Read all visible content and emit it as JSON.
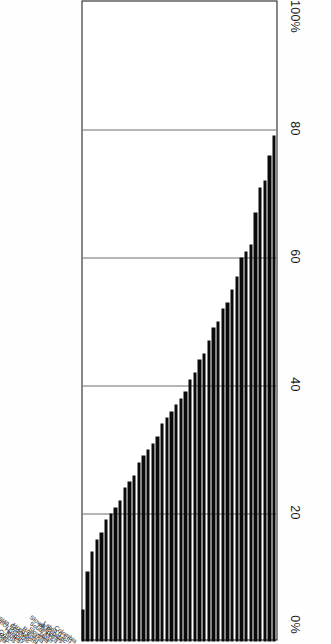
{
  "chart_data": {
    "type": "bar",
    "orientation": "vertical-rotated",
    "title": "",
    "subtitle": "",
    "xlabel": "",
    "ylabel": "",
    "ylim": [
      0,
      100
    ],
    "yticks": [
      "0%",
      "20",
      "40",
      "60",
      "80",
      "100%"
    ],
    "ytick_values": [
      0,
      20,
      40,
      60,
      80,
      100
    ],
    "axis_labels_display_order": [
      "100%",
      "80",
      "60",
      "40",
      "20",
      "0%"
    ],
    "grid": true,
    "legend": null,
    "legend_position": "none",
    "bar_color": "#0a0a0a",
    "categories": [
      "Colombia",
      "Latvia (LSS)",
      "Slovak Republic",
      "Philippines",
      "South Africa",
      "Japan",
      "Slovenia",
      "Romania",
      "Hong Kong",
      "Russian Federation",
      "Czech Republic",
      "Hungary",
      "Korea",
      "Cyprus",
      "Iran, Islamic Rep.",
      "Lithuania",
      "Greece",
      "Singapore",
      "Iceland",
      "U.S.A.",
      "Belgium (Fr)",
      "Belgium (Fl)",
      "Spain",
      "Ireland",
      "Canada",
      "Thailand",
      "Kuwait",
      "Israel",
      "Switzerland",
      "Poland",
      "Portugal",
      "New Zealand",
      "Scotland",
      "Australia",
      "Austria",
      "Netherlands",
      "France",
      "Sweden",
      "Germany",
      "Norway",
      "England",
      "Denmark"
    ],
    "values": [
      79,
      76,
      72,
      71,
      67,
      62,
      61,
      60,
      57,
      55,
      53,
      52,
      50,
      49,
      47,
      45,
      44,
      42,
      41,
      39,
      38,
      37,
      36,
      35,
      34,
      32,
      31,
      30,
      29,
      28,
      26,
      25,
      24,
      22,
      21,
      20,
      19,
      17,
      16,
      14,
      11,
      5
    ]
  }
}
